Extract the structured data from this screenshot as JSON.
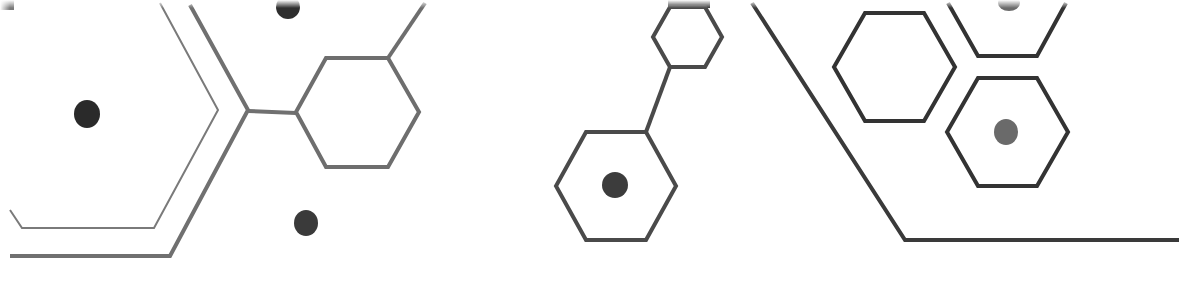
{
  "artwork": {
    "description": "Decorative molecular hexagon pattern",
    "colors": {
      "background": "#ffffff",
      "stroke_gray": "#6e6e6e",
      "stroke_dark": "#3a3a3a",
      "dot_dark": "#2e2e2e",
      "dot_gray": "#6a6a6a"
    }
  }
}
